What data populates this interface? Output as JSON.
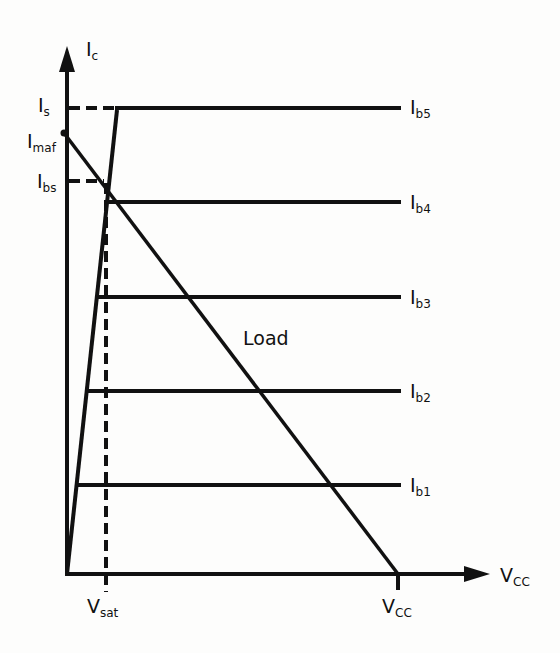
{
  "diagram": {
    "title": "",
    "type": "transistor output characteristics with load line",
    "axes": {
      "y_label_main": "I",
      "y_label_sub": "c",
      "x_label_main": "V",
      "x_label_sub": "CC"
    },
    "y_markers": [
      {
        "id": "is",
        "main": "I",
        "sub": "s"
      },
      {
        "id": "imaf",
        "main": "I",
        "sub": "maf"
      },
      {
        "id": "ibs",
        "main": "I",
        "sub": "bs"
      }
    ],
    "x_markers": [
      {
        "id": "vsat",
        "main": "V",
        "sub": "sat"
      },
      {
        "id": "vcc",
        "main": "V",
        "sub": "CC"
      }
    ],
    "curves": [
      {
        "id": "ib5",
        "main": "I",
        "sub": "b5"
      },
      {
        "id": "ib4",
        "main": "I",
        "sub": "b4"
      },
      {
        "id": "ib3",
        "main": "I",
        "sub": "b3"
      },
      {
        "id": "ib2",
        "main": "I",
        "sub": "b2"
      },
      {
        "id": "ib1",
        "main": "I",
        "sub": "b1"
      }
    ],
    "load_line_label": "Load",
    "colors": {
      "line": "#111111",
      "background": "#fdfdfc"
    }
  }
}
